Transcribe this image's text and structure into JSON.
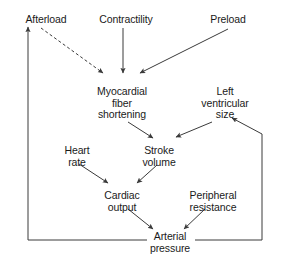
{
  "diagram": {
    "type": "flow-diagram",
    "colors": {
      "stroke": "#3a3a3a",
      "text": "#1a1a1a",
      "background": "#ffffff"
    },
    "nodes": [
      {
        "id": "afterload",
        "label": "Afterload",
        "x": 46,
        "y": 14
      },
      {
        "id": "contractility",
        "label": "Contractility",
        "x": 126,
        "y": 14
      },
      {
        "id": "preload",
        "label": "Preload",
        "x": 228,
        "y": 14
      },
      {
        "id": "myocardial_fiber_shortening",
        "label": "Myocardial\nfiber\nshortening",
        "x": 122,
        "y": 86
      },
      {
        "id": "left_ventricular_size",
        "label": "Left\nventricular\nsize",
        "x": 225,
        "y": 86
      },
      {
        "id": "heart_rate",
        "label": "Heart\nrate",
        "x": 77,
        "y": 145
      },
      {
        "id": "stroke_volume",
        "label": "Stroke\nvolume",
        "x": 159,
        "y": 145
      },
      {
        "id": "cardiac_output",
        "label": "Cardiac\noutput",
        "x": 122,
        "y": 190
      },
      {
        "id": "peripheral_resistance",
        "label": "Peripheral\nresistance",
        "x": 213,
        "y": 190
      },
      {
        "id": "arterial_pressure",
        "label": "Arterial\npressure",
        "x": 170,
        "y": 236
      }
    ],
    "edges": [
      {
        "id": "afterload-to-myocardial",
        "from": "afterload",
        "to": "myocardial_fiber_shortening",
        "style": "dashed",
        "arrow": true
      },
      {
        "id": "contractility-to-myocardial",
        "from": "contractility",
        "to": "myocardial_fiber_shortening",
        "style": "solid",
        "arrow": true
      },
      {
        "id": "preload-to-myocardial",
        "from": "preload",
        "to": "myocardial_fiber_shortening",
        "style": "solid",
        "arrow": true
      },
      {
        "id": "myocardial-to-stroke-volume",
        "from": "myocardial_fiber_shortening",
        "to": "stroke_volume",
        "style": "solid",
        "arrow": true
      },
      {
        "id": "lv-size-to-stroke-volume",
        "from": "left_ventricular_size",
        "to": "stroke_volume",
        "style": "solid",
        "arrow": true
      },
      {
        "id": "heart-rate-to-cardiac-output",
        "from": "heart_rate",
        "to": "cardiac_output",
        "style": "solid",
        "arrow": true
      },
      {
        "id": "stroke-volume-to-cardiac-output",
        "from": "stroke_volume",
        "to": "cardiac_output",
        "style": "solid",
        "arrow": true
      },
      {
        "id": "cardiac-output-to-arterial-pressure",
        "from": "cardiac_output",
        "to": "arterial_pressure",
        "style": "solid",
        "arrow": true
      },
      {
        "id": "peripheral-resistance-to-arterial-pressure",
        "from": "peripheral_resistance",
        "to": "arterial_pressure",
        "style": "solid",
        "arrow": true
      },
      {
        "id": "arterial-pressure-to-afterload",
        "from": "arterial_pressure",
        "to": "afterload",
        "style": "solid-feedback-left",
        "arrow": true
      },
      {
        "id": "arterial-pressure-to-lv-size",
        "from": "arterial_pressure",
        "to": "left_ventricular_size",
        "style": "solid-feedback-right",
        "arrow": true
      }
    ]
  }
}
